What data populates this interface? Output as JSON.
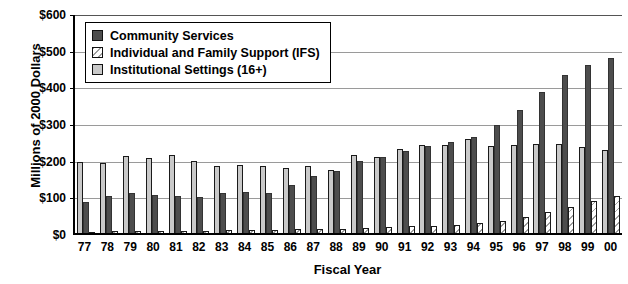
{
  "chart_data": {
    "type": "bar",
    "title": "",
    "xlabel": "Fiscal Year",
    "ylabel": "Millions of 2000 Dollars",
    "ylim": [
      0,
      600
    ],
    "ytick_labels": [
      "$600",
      "$500",
      "$400",
      "$300",
      "$200",
      "$100",
      "$0"
    ],
    "ytick_values": [
      600,
      500,
      400,
      300,
      200,
      100,
      0
    ],
    "grid": true,
    "legend_position": "upper-left-inside",
    "categories": [
      "77",
      "78",
      "79",
      "80",
      "81",
      "82",
      "83",
      "84",
      "85",
      "86",
      "87",
      "88",
      "89",
      "90",
      "91",
      "92",
      "93",
      "94",
      "95",
      "96",
      "97",
      "98",
      "99",
      "00"
    ],
    "series": [
      {
        "name": "Community Services",
        "color": "#4d4d4d",
        "pattern": "solid",
        "values": [
          85,
          100,
          110,
          105,
          102,
          98,
          110,
          113,
          110,
          132,
          155,
          168,
          196,
          208,
          224,
          238,
          248,
          262,
          295,
          335,
          385,
          432,
          457,
          477
        ]
      },
      {
        "name": "Individual and Family Support (IFS)",
        "color": "#eeeeee",
        "pattern": "diagonal-hatch",
        "values": [
          4,
          5,
          5,
          6,
          6,
          6,
          7,
          8,
          9,
          10,
          11,
          12,
          14,
          16,
          18,
          20,
          22,
          26,
          34,
          44,
          56,
          70,
          86,
          100
        ]
      },
      {
        "name": "Institutional Settings (16+)",
        "color": "#c9c9c9",
        "pattern": "solid",
        "values": [
          195,
          192,
          210,
          205,
          214,
          196,
          182,
          186,
          182,
          178,
          182,
          172,
          214,
          206,
          228,
          239,
          240,
          257,
          238,
          241,
          243,
          243,
          235,
          226
        ]
      }
    ],
    "group_order": [
      "Institutional Settings (16+)",
      "Community Services",
      "Individual and Family Support (IFS)"
    ]
  },
  "legend": {
    "items": [
      {
        "label": "Community Services",
        "swatch": "comm"
      },
      {
        "label": "Individual and Family Support (IFS)",
        "swatch": "ifs"
      },
      {
        "label": "Institutional Settings (16+)",
        "swatch": "inst"
      }
    ]
  }
}
